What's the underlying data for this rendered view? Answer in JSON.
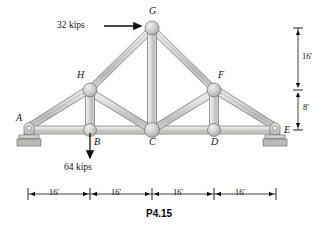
{
  "figure": {
    "caption": "P4.15",
    "type": "plane-truss-diagram"
  },
  "joints": [
    {
      "id": "A",
      "label": "A",
      "x": 28,
      "y": 130,
      "label_x": 16,
      "label_y": 118,
      "support": "pin"
    },
    {
      "id": "B",
      "label": "B",
      "x": 90,
      "y": 130,
      "label_x": 94,
      "label_y": 142,
      "support": "none"
    },
    {
      "id": "C",
      "label": "C",
      "x": 152,
      "y": 130,
      "label_x": 149,
      "label_y": 142,
      "support": "none"
    },
    {
      "id": "D",
      "label": "D",
      "x": 214,
      "y": 130,
      "label_x": 211,
      "label_y": 142,
      "support": "none"
    },
    {
      "id": "E",
      "label": "E",
      "x": 276,
      "y": 130,
      "label_x": 284,
      "label_y": 129,
      "support": "roller"
    },
    {
      "id": "F",
      "label": "F",
      "x": 214,
      "y": 90,
      "label_x": 219,
      "label_y": 74,
      "support": "none"
    },
    {
      "id": "G",
      "label": "G",
      "x": 152,
      "y": 28,
      "label_x": 150,
      "label_y": 10,
      "support": "none"
    },
    {
      "id": "H",
      "label": "H",
      "x": 90,
      "y": 90,
      "label_x": 78,
      "label_y": 74,
      "support": "none"
    }
  ],
  "members": [
    {
      "from": "A",
      "to": "B",
      "kind": "bottom-chord"
    },
    {
      "from": "B",
      "to": "C",
      "kind": "bottom-chord"
    },
    {
      "from": "C",
      "to": "D",
      "kind": "bottom-chord"
    },
    {
      "from": "D",
      "to": "E",
      "kind": "bottom-chord"
    },
    {
      "from": "A",
      "to": "H",
      "kind": "top-chord"
    },
    {
      "from": "H",
      "to": "G",
      "kind": "top-chord"
    },
    {
      "from": "G",
      "to": "F",
      "kind": "top-chord"
    },
    {
      "from": "F",
      "to": "E",
      "kind": "top-chord"
    },
    {
      "from": "H",
      "to": "B",
      "kind": "vertical"
    },
    {
      "from": "G",
      "to": "C",
      "kind": "vertical"
    },
    {
      "from": "F",
      "to": "D",
      "kind": "vertical"
    },
    {
      "from": "H",
      "to": "C",
      "kind": "diagonal"
    },
    {
      "from": "F",
      "to": "C",
      "kind": "diagonal"
    }
  ],
  "loads": [
    {
      "id": "load-g",
      "label": "32 kips",
      "magnitude": 32,
      "unit": "kips",
      "direction": "horizontal-right",
      "applied_at": "G",
      "text_x": 57,
      "text_y": 22,
      "arrow_x1": 104,
      "arrow_y1": 26,
      "arrow_x2": 142,
      "arrow_y2": 26
    },
    {
      "id": "load-b",
      "label": "64 kips",
      "magnitude": 64,
      "unit": "kips",
      "direction": "vertical-down",
      "applied_at": "B",
      "text_x": 66,
      "text_y": 166,
      "arrow_x1": 90,
      "arrow_y1": 133,
      "arrow_x2": 90,
      "arrow_y2": 160
    }
  ],
  "dimensions": {
    "vertical": {
      "line_x": 298,
      "top_y": 28,
      "mid_y": 90,
      "bottom_y": 130,
      "segments": [
        {
          "label": "16'",
          "value": 16,
          "unit": "ft",
          "text_x": 302,
          "text_y": 55
        },
        {
          "label": "8'",
          "value": 8,
          "unit": "ft",
          "text_x": 303,
          "text_y": 106
        }
      ]
    },
    "horizontal": {
      "line_y": 194,
      "ticks": [
        28,
        90,
        152,
        214,
        276
      ],
      "segments": [
        {
          "label": "16'",
          "value": 16,
          "unit": "ft",
          "text_x": 51,
          "text_y": 190
        },
        {
          "label": "16'",
          "value": 16,
          "unit": "ft",
          "text_x": 113,
          "text_y": 190
        },
        {
          "label": "16'",
          "value": 16,
          "unit": "ft",
          "text_x": 175,
          "text_y": 190
        },
        {
          "label": "16'",
          "value": 16,
          "unit": "ft",
          "text_x": 237,
          "text_y": 190
        }
      ]
    }
  },
  "caption_pos": {
    "x": 147,
    "y": 212
  },
  "colors": {
    "member_fill_light": "#e6e6e4",
    "member_fill_mid": "#c9c9c6",
    "member_edge": "#6f6f6d",
    "joint_fill": "#c4c4c1",
    "support_fill": "#d2d2cf",
    "ink": "#111111",
    "background": "#ffffff"
  }
}
